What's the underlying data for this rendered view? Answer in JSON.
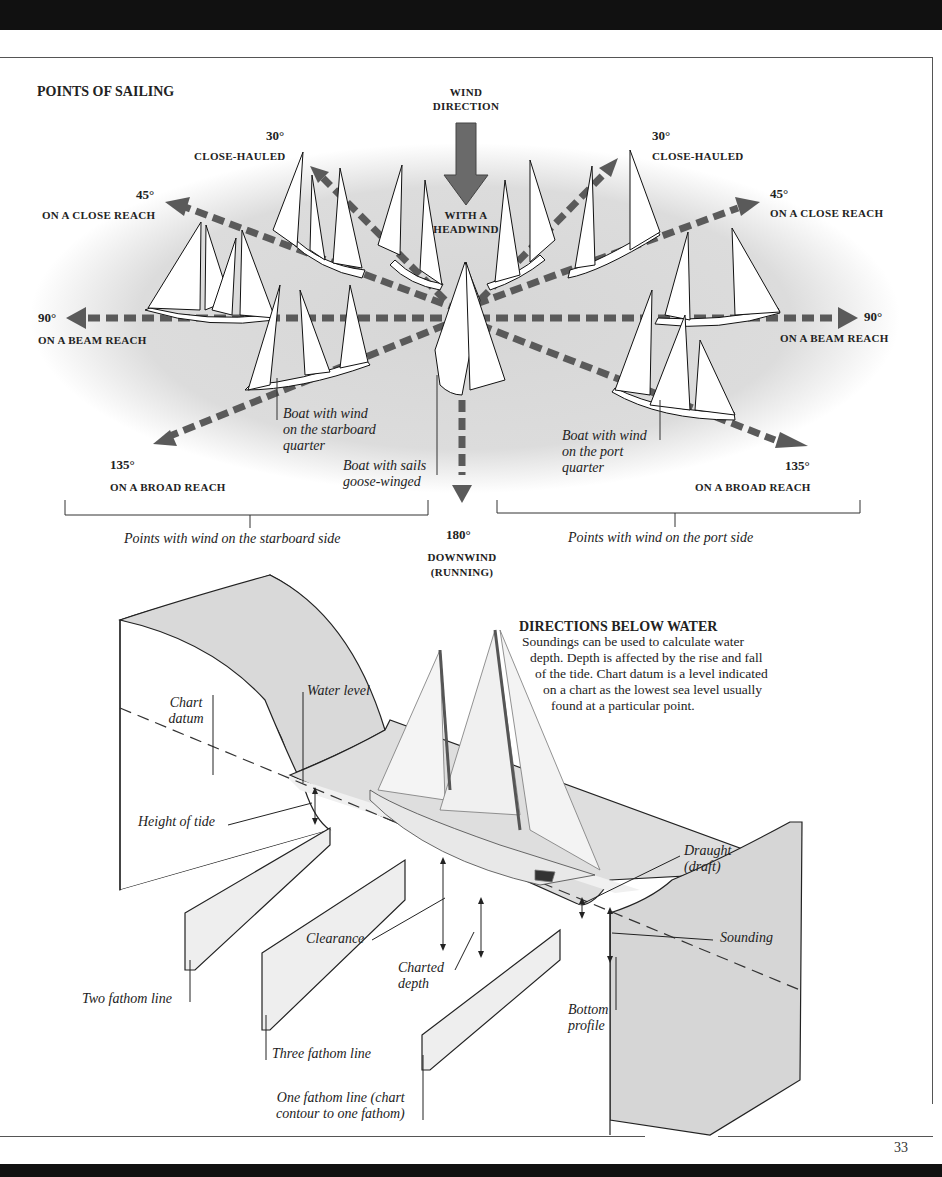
{
  "page": {
    "number": "33"
  },
  "points_of_sailing": {
    "title": "POINTS OF SAILING",
    "wind": {
      "line1": "WIND",
      "line2": "DIRECTION"
    },
    "headwind": {
      "line1": "WITH A",
      "line2": "HEADWIND"
    },
    "left": {
      "close_hauled": {
        "deg": "30°",
        "label": "CLOSE-HAULED"
      },
      "close_reach": {
        "deg": "45°",
        "label": "ON A CLOSE REACH"
      },
      "beam_reach": {
        "deg": "90°",
        "label": "ON A BEAM REACH"
      },
      "broad_reach": {
        "deg": "135°",
        "label": "ON A BROAD REACH"
      }
    },
    "right": {
      "close_hauled": {
        "deg": "30°",
        "label": "CLOSE-HAULED"
      },
      "close_reach": {
        "deg": "45°",
        "label": "ON A CLOSE REACH"
      },
      "beam_reach": {
        "deg": "90°",
        "label": "ON A BEAM REACH"
      },
      "broad_reach": {
        "deg": "135°",
        "label": "ON A BROAD REACH"
      }
    },
    "downwind": {
      "deg": "180°",
      "line1": "DOWNWIND",
      "line2": "(RUNNING)"
    },
    "annotations": {
      "starboard_quarter": [
        "Boat with wind",
        "on the starboard",
        "quarter"
      ],
      "goose_winged": [
        "Boat with sails",
        "goose-winged"
      ],
      "port_quarter": [
        "Boat with wind",
        "on the port",
        "quarter"
      ]
    },
    "brackets": {
      "starboard": "Points with wind on the starboard side",
      "port": "Points with wind on the port side"
    }
  },
  "below_water": {
    "title": "DIRECTIONS BELOW WATER",
    "body": [
      "Soundings can be used to calculate water",
      "depth. Depth is affected by the rise and fall",
      "of the tide. Chart datum is a level indicated",
      "on a chart as the lowest sea level usually",
      "found at a particular point."
    ],
    "labels": {
      "chart_datum": [
        "Chart",
        "datum"
      ],
      "water_level": "Water level",
      "height_of_tide": "Height of tide",
      "draught": [
        "Draught",
        "(draft)"
      ],
      "clearance": "Clearance",
      "sounding": "Sounding",
      "charted_depth": [
        "Charted",
        "depth"
      ],
      "bottom_profile": [
        "Bottom",
        "profile"
      ],
      "two_fathom": "Two fathom line",
      "three_fathom": "Three fathom line",
      "one_fathom": [
        "One fathom line (chart",
        "contour to one fathom)"
      ]
    }
  },
  "colors": {
    "arrow": "#5a5a5a",
    "sea": "#d9d9d9",
    "ink": "#222222"
  }
}
